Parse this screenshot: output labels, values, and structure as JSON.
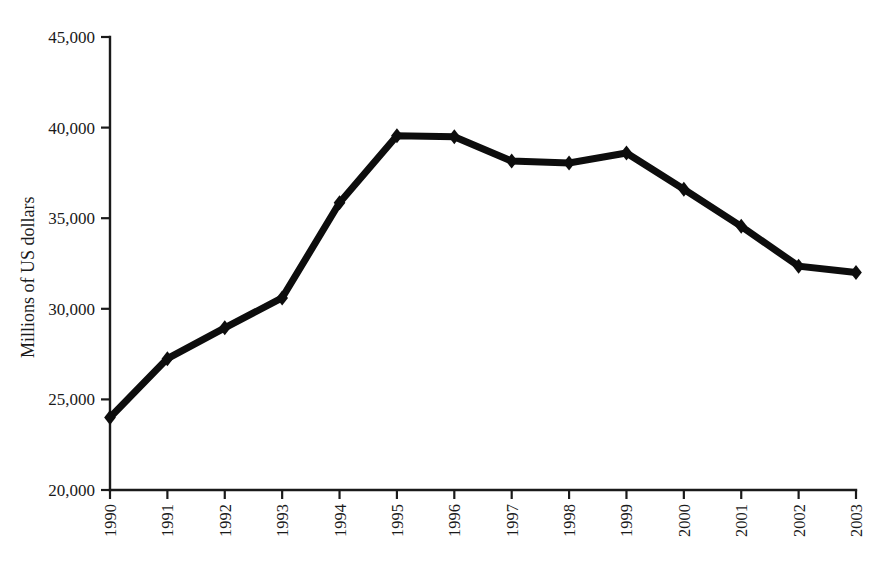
{
  "chart_data": {
    "type": "line",
    "title": "",
    "subtitle": "",
    "xlabel": "",
    "ylabel": "Millions of US dollars",
    "categories": [
      "1990",
      "1991",
      "1992",
      "1993",
      "1994",
      "1995",
      "1996",
      "1997",
      "1998",
      "1999",
      "2000",
      "2001",
      "2002",
      "2003"
    ],
    "values": [
      24000,
      27250,
      28950,
      30600,
      35850,
      39550,
      39500,
      38150,
      38050,
      38600,
      36600,
      34550,
      32350,
      32000
    ],
    "series": [
      {
        "name": "Millions of US dollars",
        "values": [
          24000,
          27250,
          28950,
          30600,
          35850,
          39550,
          39500,
          38150,
          38050,
          38600,
          36600,
          34550,
          32350,
          32000
        ]
      }
    ],
    "ylim": [
      20000,
      45000
    ],
    "ytick_values": [
      20000,
      25000,
      30000,
      35000,
      40000,
      45000
    ],
    "ytick_labels": [
      "20,000",
      "25,000",
      "30,000",
      "35,000",
      "40,000",
      "45,000"
    ],
    "xtick_labels": [
      "1990",
      "1991",
      "1992",
      "1993",
      "1994",
      "1995",
      "1996",
      "1997",
      "1998",
      "1999",
      "2000",
      "2001",
      "2002",
      "2003"
    ],
    "grid": false,
    "legend": false,
    "legend_position": "none",
    "marker": "diamond",
    "line_color": "#0d0d0d",
    "axis_color": "#1a1a1a",
    "background_color": "#ffffff",
    "xlabel_rotation": -90,
    "ylabel_rotation": -90,
    "annotations": []
  },
  "axes": {
    "y_axis_title": "Millions of US dollars",
    "x_axis_title": ""
  }
}
